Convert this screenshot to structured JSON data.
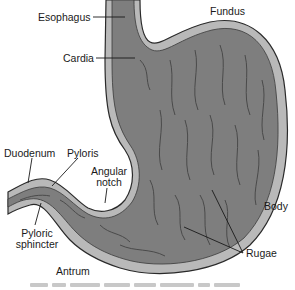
{
  "figure": {
    "colors": {
      "outer_wall": "#b9b9b9",
      "wall_outline": "#2a2a2a",
      "lumen": "#7e7e7e",
      "rugae_fold": "#555555",
      "background": "#ffffff"
    }
  },
  "labels": {
    "esophagus": "Esophagus",
    "fundus": "Fundus",
    "cardia": "Cardia",
    "duodenum": "Duodenum",
    "pyloris": "Pyloris",
    "angular_notch_line1": "Angular",
    "angular_notch_line2": "notch",
    "body": "Body",
    "pyloric_sphincter_line1": "Pyloric",
    "pyloric_sphincter_line2": "sphincter",
    "rugae": "Rugae",
    "antrum": "Antrum"
  }
}
